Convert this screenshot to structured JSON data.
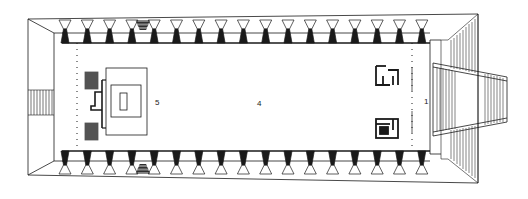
{
  "drawing": {
    "type": "architectural floor plan",
    "colors": {
      "ink": "#1a1a1a",
      "paper": "#ffffff",
      "hatch": "#333333"
    },
    "labels": [
      {
        "id": "5",
        "text": "5",
        "x": 155,
        "y": 99
      },
      {
        "id": "4",
        "text": "4",
        "x": 257,
        "y": 100
      },
      {
        "id": "1",
        "text": "1",
        "x": 424,
        "y": 98
      }
    ],
    "colonnade": {
      "count_per_side": 17,
      "first_x": 65,
      "spacing": 22.3,
      "top_row_y": [
        19,
        43
      ],
      "bottom_row_y": [
        151,
        175
      ],
      "hatched_bay_index": 3
    },
    "elements": [
      "outer-platform",
      "left-steps",
      "top-colonnade",
      "bottom-colonnade",
      "inner-hall",
      "altar-dais",
      "right-ramp",
      "right-screens"
    ]
  }
}
